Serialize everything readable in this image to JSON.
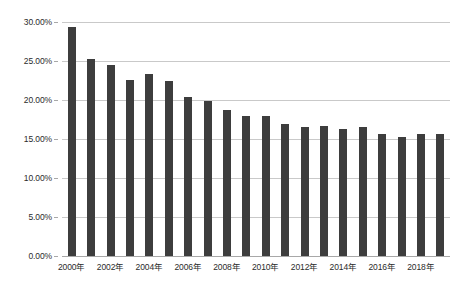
{
  "chart_data": {
    "type": "bar",
    "title": "",
    "subtitle": "",
    "xlabel": "",
    "ylabel": "",
    "categories": [
      "2000年",
      "2001年",
      "2002年",
      "2003年",
      "2004年",
      "2005年",
      "2006年",
      "2007年",
      "2008年",
      "2009年",
      "2010年",
      "2011年",
      "2012年",
      "2013年",
      "2014年",
      "2015年",
      "2016年",
      "2017年",
      "2018年",
      "2019年"
    ],
    "values": [
      29.3,
      25.2,
      24.5,
      22.6,
      23.3,
      22.5,
      20.4,
      19.9,
      18.7,
      18.0,
      17.9,
      16.9,
      16.5,
      16.7,
      16.3,
      16.6,
      15.6,
      15.3,
      15.6,
      15.7
    ],
    "value_unit": "%",
    "ylim": [
      0,
      30
    ],
    "y_tick_values": [
      0,
      5,
      10,
      15,
      20,
      25,
      30
    ],
    "y_tick_labels": [
      "0.00%",
      "5.00%",
      "10.00%",
      "15.00%",
      "20.00%",
      "25.00%",
      "30.00%"
    ],
    "x_tick_labels": [
      "2000年",
      "2002年",
      "2004年",
      "2006年",
      "2008年",
      "2010年",
      "2012年",
      "2014年",
      "2016年",
      "2018年"
    ],
    "x_tick_category_indices": [
      0,
      2,
      4,
      6,
      8,
      10,
      12,
      14,
      16,
      18
    ],
    "grid": true,
    "grid_axis": "y",
    "legend": false,
    "legend_position": "none",
    "series": [
      {
        "name": "",
        "color": "#3d3d3d",
        "values": [
          29.3,
          25.2,
          24.5,
          22.6,
          23.3,
          22.5,
          20.4,
          19.9,
          18.7,
          18.0,
          17.9,
          16.9,
          16.5,
          16.7,
          16.3,
          16.6,
          15.6,
          15.3,
          15.6,
          15.7
        ]
      }
    ]
  },
  "style": {
    "bar_color": "#3d3d3d",
    "gridline_color": "#c9c9c9",
    "axis_color": "#a8a8a8",
    "text_color": "#2b2b2b",
    "background_color": "#ffffff"
  }
}
